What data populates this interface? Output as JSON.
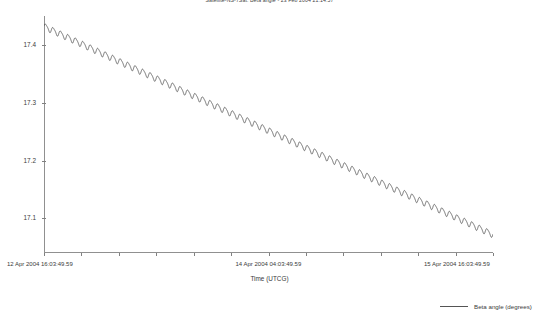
{
  "chart_data": {
    "type": "line",
    "title": "Satellite-NS-7Sat: Beta angle - 23 Feb 2004 21:14:57",
    "xlabel": "Time (UTCG)",
    "ylabel": "",
    "grid": false,
    "legend_position": "bottom-right",
    "series": [
      {
        "name": "Beta angle (degrees)",
        "color": "#555555",
        "description": "Monotonically decreasing beta angle with superimposed high-frequency orbital oscillation (~60 cycles over the span, peak-to-peak amplitude ~0.012 degrees)",
        "trend_start_value": 17.432,
        "trend_end_value": 17.072,
        "oscillation_cycles": 60,
        "oscillation_amplitude": 0.0065
      }
    ],
    "ylim": [
      17.04,
      17.45
    ],
    "yticks": [
      17.1,
      17.2,
      17.3,
      17.4
    ],
    "ytick_labels": [
      "17.1",
      "17.2",
      "17.3",
      "17.4"
    ],
    "xlim_labels": [
      "12 Apr 2004 16:03:49.59",
      "15 Apr 2004 16:03:49.59"
    ],
    "xticks": [
      {
        "label": "12 Apr 2004 16:03:49.59",
        "position": 0.0
      },
      {
        "label": "14 Apr 2004 04:03:49.59",
        "position": 0.5
      },
      {
        "label": "15 Apr 2004 16:03:49.59",
        "position": 1.0
      }
    ],
    "x_minor_tick_count": 12
  },
  "legend": {
    "entries": [
      {
        "label": "Beta angle (degrees)",
        "color": "#555555"
      }
    ]
  }
}
